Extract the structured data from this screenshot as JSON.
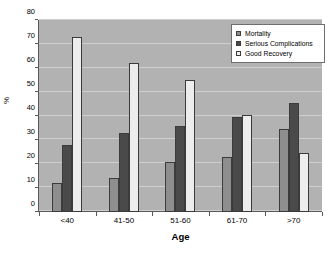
{
  "chart_data": {
    "type": "bar",
    "title": "",
    "xlabel": "Age",
    "ylabel": "%",
    "categories": [
      "<40",
      "41-50",
      "51-60",
      "61-70",
      ">70"
    ],
    "series": [
      {
        "name": "Mortality",
        "values": [
          12,
          14,
          21,
          23,
          34.5
        ],
        "color": "#8e8e8e"
      },
      {
        "name": "Serious Complications",
        "values": [
          28,
          33,
          36,
          39.5,
          45.5
        ],
        "color": "#4a4a4a"
      },
      {
        "name": "Good Recovery",
        "values": [
          73,
          62,
          55,
          40.5,
          24.5
        ],
        "color": "#ededed"
      }
    ],
    "ylim": [
      0,
      80
    ],
    "yticks": [
      80,
      70,
      60,
      50,
      40,
      30,
      20,
      10,
      0
    ],
    "grid": true,
    "legend_position": "top-right",
    "plot_background": "#b2b2b2",
    "figure_background": "#ffffff"
  }
}
